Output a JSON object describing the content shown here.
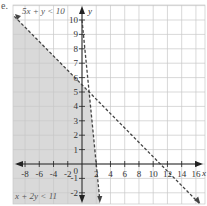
{
  "part_label": "e.",
  "chart_data": {
    "type": "line",
    "title": "",
    "xlabel": "x",
    "ylabel": "y",
    "xlim": [
      -11,
      17.5
    ],
    "ylim": [
      -2.8,
      11.3
    ],
    "grid": true,
    "x_ticks": [
      -8,
      -6,
      -4,
      -2,
      2,
      4,
      6,
      8,
      10,
      12,
      14,
      16
    ],
    "x_tick_labels": [
      "-8",
      "-6",
      "-4",
      "-2",
      "2",
      "4",
      "6",
      "8",
      "10",
      "12",
      "14",
      "16"
    ],
    "y_ticks": [
      -2,
      -1,
      1,
      2,
      3,
      4,
      5,
      6,
      7,
      8,
      9,
      10
    ],
    "y_tick_labels": [
      "-2",
      "-1",
      "1",
      "2",
      "3",
      "4",
      "5",
      "6",
      "7",
      "8",
      "9",
      "10"
    ],
    "origin_label": "0",
    "series": [
      {
        "name": "5x + y < 10",
        "boundary": "5x + y = 10",
        "style": "dashed",
        "points": [
          [
            0,
            10
          ],
          [
            2,
            0
          ],
          [
            2.5,
            -2.5
          ]
        ]
      },
      {
        "name": "x + 2y < 11",
        "boundary": "x + 2y = 11",
        "style": "dashed",
        "points": [
          [
            -10,
            10.5
          ],
          [
            0,
            5.5
          ],
          [
            11,
            0
          ],
          [
            16.5,
            -2.75
          ]
        ]
      }
    ],
    "annotations": [
      {
        "text": "5x + y < 10",
        "position": "top-left"
      },
      {
        "text": "x + 2y < 11",
        "position": "bottom-left"
      }
    ],
    "shaded_region": "5x + y < 10 and x + 2y < 11",
    "colors": {
      "shade": "#d9d9d9",
      "grid": "#c8c8c8",
      "axis": "#222222",
      "line": "#444444"
    }
  }
}
